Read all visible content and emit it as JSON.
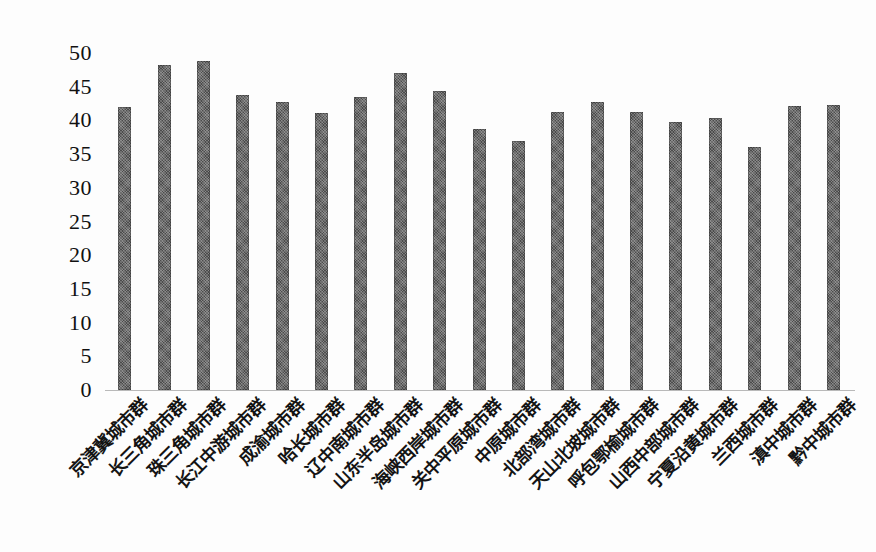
{
  "chart_data": {
    "type": "bar",
    "title": "",
    "subtitle": "",
    "xlabel": "",
    "ylabel": "",
    "ylim": [
      0,
      50
    ],
    "ytick_step": 5,
    "yticks": [
      50,
      45,
      40,
      35,
      30,
      25,
      20,
      15,
      10,
      5,
      0
    ],
    "grid": false,
    "legend": "none",
    "bar_color": "#5c5c5c",
    "label_rotation_deg": -45,
    "categories": [
      "京津冀城市群",
      "长三角城市群",
      "珠三角城市群",
      "长江中游城市群",
      "成渝城市群",
      "哈长城市群",
      "辽中南城市群",
      "山东半岛城市群",
      "海峡西岸城市群",
      "关中平原城市群",
      "中原城市群",
      "北部湾城市群",
      "天山北坡城市群",
      "呼包鄂榆城市群",
      "山西中部城市群",
      "宁夏沿黄城市群",
      "兰西城市群",
      "滇中城市群",
      "黔中城市群"
    ],
    "values": [
      42.0,
      48.2,
      48.8,
      43.8,
      42.7,
      41.1,
      43.5,
      47.0,
      44.4,
      38.7,
      36.9,
      41.2,
      42.8,
      41.3,
      39.8,
      40.4,
      36.0,
      42.1,
      42.3
    ]
  }
}
